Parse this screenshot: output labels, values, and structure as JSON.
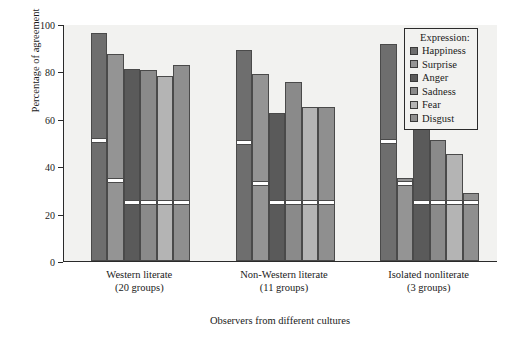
{
  "chart_data": {
    "type": "bar",
    "title": "",
    "xlabel": "Observers from different cultures",
    "ylabel": "Percentage of agreement",
    "ylim": [
      0,
      100
    ],
    "yticks": [
      0,
      20,
      40,
      60,
      80,
      100
    ],
    "grid": false,
    "legend_position": "top-right",
    "legend_title": "Expression:",
    "categories": [
      "Western literate\n(20 groups)",
      "Non-Western literate\n(11 groups)",
      "Isolated nonliterate\n(3 groups)"
    ],
    "category_labels": [
      {
        "line1": "Western literate",
        "line2": "(20 groups)"
      },
      {
        "line1": "Non-Western literate",
        "line2": "(11 groups)"
      },
      {
        "line1": "Isolated nonliterate",
        "line2": "(3 groups)"
      }
    ],
    "series": [
      {
        "name": "Happiness",
        "color": "#6e6e6e",
        "values": [
          96.0,
          89.0,
          91.5
        ]
      },
      {
        "name": "Surprise",
        "color": "#949494",
        "values": [
          87.5,
          79.0,
          35.0
        ]
      },
      {
        "name": "Anger",
        "color": "#5a5a5a",
        "values": [
          81.0,
          62.5,
          55.5
        ]
      },
      {
        "name": "Sadness",
        "color": "#8a8a8a",
        "values": [
          80.5,
          75.5,
          51.0
        ]
      },
      {
        "name": "Fear",
        "color": "#b4b4b4",
        "values": [
          78.0,
          65.0,
          45.0
        ]
      },
      {
        "name": "Disgust",
        "color": "#8f8f8f",
        "values": [
          82.5,
          65.0,
          28.5
        ]
      }
    ],
    "marker_lines": [
      {
        "group": 0,
        "series": "Happiness",
        "value": 50.0
      },
      {
        "group": 0,
        "series": "Surprise",
        "value": 33.0
      },
      {
        "group": 0,
        "series": "Anger",
        "value": 24.0
      },
      {
        "group": 0,
        "series": "Sadness",
        "value": 24.0
      },
      {
        "group": 0,
        "series": "Fear",
        "value": 24.0
      },
      {
        "group": 0,
        "series": "Disgust",
        "value": 24.0
      },
      {
        "group": 1,
        "series": "Happiness",
        "value": 49.0
      },
      {
        "group": 1,
        "series": "Surprise",
        "value": 32.0
      },
      {
        "group": 1,
        "series": "Anger",
        "value": 24.0
      },
      {
        "group": 1,
        "series": "Sadness",
        "value": 24.0
      },
      {
        "group": 1,
        "series": "Fear",
        "value": 24.0
      },
      {
        "group": 1,
        "series": "Disgust",
        "value": 24.0
      },
      {
        "group": 2,
        "series": "Happiness",
        "value": 49.5
      },
      {
        "group": 2,
        "series": "Surprise",
        "value": 32.0
      },
      {
        "group": 2,
        "series": "Anger",
        "value": 24.0
      },
      {
        "group": 2,
        "series": "Sadness",
        "value": 24.0
      },
      {
        "group": 2,
        "series": "Fear",
        "value": 24.0
      },
      {
        "group": 2,
        "series": "Disgust",
        "value": 24.0
      }
    ],
    "colors": {
      "plot_background": "#f2f2f0",
      "page_background": "#ffffff",
      "axis": "#2a2a2a",
      "bar_edge": "#4a4a4a",
      "marker": "#ffffff"
    }
  }
}
